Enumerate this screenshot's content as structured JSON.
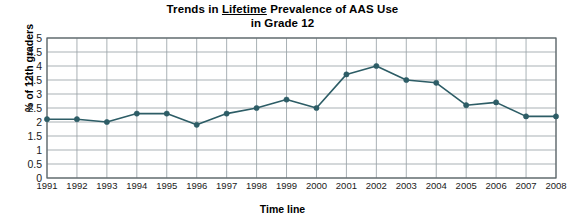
{
  "chart_data": {
    "type": "line",
    "title": "Trends in Lifetime Prevalence of AAS Use in Grade 12",
    "title_line1_pre": "Trends in ",
    "title_line1_underlined": "Lifetime",
    "title_line1_post": " Prevalence of AAS Use",
    "title_line2": "in Grade 12",
    "xlabel": "Time line",
    "ylabel": "% of 12th graders",
    "ylim": [
      0,
      5
    ],
    "ytick_labels": [
      "0",
      "0.5",
      "1",
      "1.5",
      "2",
      "2.5",
      "3",
      "3.5",
      "4",
      "4.5",
      "5"
    ],
    "ytick_values": [
      0,
      0.5,
      1,
      1.5,
      2,
      2.5,
      3,
      3.5,
      4,
      4.5,
      5
    ],
    "grid": true,
    "legend": "none",
    "categories": [
      "1991",
      "1992",
      "1993",
      "1994",
      "1995",
      "1996",
      "1997",
      "1998",
      "1999",
      "2000",
      "2001",
      "2002",
      "2003",
      "2004",
      "2005",
      "2006",
      "2007",
      "2008"
    ],
    "values": [
      2.1,
      2.1,
      2.0,
      2.3,
      2.3,
      1.9,
      2.3,
      2.5,
      2.8,
      2.5,
      3.7,
      4.0,
      3.5,
      3.4,
      2.6,
      2.7,
      2.2,
      2.2
    ],
    "series_color": "#2d5d66",
    "grid_color": "#9aa3a8",
    "axis_color": "#5a6468",
    "background": "#ffffff"
  }
}
